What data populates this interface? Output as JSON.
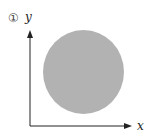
{
  "figure": {
    "number_label": "①",
    "y_axis_label": "y",
    "x_axis_label": "x",
    "shape": "filled circle",
    "colors": {
      "circle_fill": "#b2b2b2",
      "axis": "#222222",
      "background": "#ffffff"
    }
  }
}
